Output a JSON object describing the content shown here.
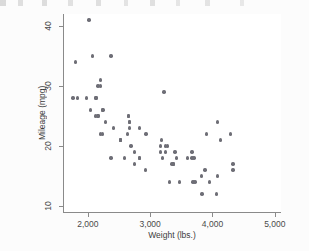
{
  "figure": {
    "background_color": "#fcfcfc",
    "plot_background_color": "#ffffff",
    "axis_color": "#8a8a8a",
    "marker_color": "#6e6e76",
    "text_color": "#3c3c3c"
  },
  "chart_data": {
    "type": "scatter",
    "title": "",
    "subtitle": "",
    "xlabel": "Weight (lbs.)",
    "ylabel": "Mileage (mpg)",
    "xlim": [
      1600,
      5100
    ],
    "ylim": [
      9,
      42
    ],
    "grid": false,
    "legend": null,
    "xticks": [
      2000,
      3000,
      4000,
      5000
    ],
    "xtick_labels": [
      "2,000",
      "3,000",
      "4,000",
      "5,000"
    ],
    "yticks": [
      10,
      20,
      30,
      40
    ],
    "ytick_labels": [
      "10",
      "20",
      "30",
      "40"
    ],
    "marker": "circle",
    "marker_size": 3.4,
    "n_points": 74,
    "series": [
      {
        "name": "Mileage vs Weight",
        "x": [
          2930,
          3350,
          2640,
          3250,
          4080,
          3670,
          2230,
          3280,
          3880,
          3400,
          3310,
          3690,
          3180,
          3220,
          4330,
          3900,
          4290,
          4080,
          3670,
          3200,
          4330,
          3370,
          4130,
          3820,
          2200,
          2520,
          2130,
          2650,
          2230,
          2690,
          3470,
          3600,
          2830,
          3700,
          3955,
          3830,
          2585,
          2370,
          2020,
          2280,
          2750,
          3170,
          2120,
          2160,
          2670,
          2750,
          2920,
          2240,
          2520,
          2130,
          2650,
          2410,
          3420,
          2830,
          3250,
          4060,
          3720,
          3370,
          2830,
          2200,
          2670,
          2370,
          2200,
          2520,
          2070,
          2160,
          1800,
          1760,
          1980,
          2670,
          2160,
          2040,
          1830,
          3170
        ],
        "y": [
          22,
          17,
          22,
          20,
          15,
          18,
          26,
          20,
          16,
          19,
          14,
          14,
          21,
          29,
          16,
          22,
          22,
          24,
          19,
          18,
          17,
          17,
          21,
          15,
          22,
          21,
          28,
          25,
          22,
          20,
          14,
          18,
          18,
          18,
          14,
          12,
          18,
          18,
          41,
          24,
          17,
          19,
          25,
          25,
          24,
          19,
          16,
          26,
          21,
          28,
          25,
          23,
          18,
          18,
          19,
          12,
          14,
          17,
          23,
          31,
          23,
          35,
          30,
          21,
          35,
          30,
          34,
          28,
          28,
          24,
          25,
          26,
          28,
          20
        ]
      }
    ]
  },
  "axis": {
    "y_title": "Mileage (mpg)",
    "x_title": "Weight (lbs.)"
  }
}
